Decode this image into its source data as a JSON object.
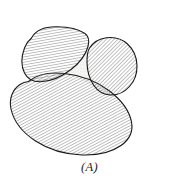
{
  "figure": {
    "caption": "(A)",
    "label": "(A)",
    "background_color": "#ffffff",
    "outline_color": "#1a1a1a",
    "hatch_color": "#6e6e6e",
    "stipple_color": "#b8b8b8",
    "void_fill_color": "#f4f4f2",
    "width": 179,
    "height": 184,
    "shapes": [
      {
        "id": "grain-top-left",
        "name": "top-left-grain",
        "hatch_angle_deg": 80,
        "hatch_spacing_px": 2.6,
        "hatch_color": "#6e6e6e",
        "outline_color": "#1a1a1a",
        "outline_width": 1.1,
        "fill": "#ffffff",
        "path": "M 31.5 38.0 C 36.0 29.5 46.0 26.6 57.0 26.8 C 68.0 27.0 79.5 29.8 85.0 33.5 C 88.8 36.2 89.6 40.5 88.0 46.5 C 86.0 54.0 80.0 62.5 71.0 69.5 C 62.0 76.5 50.0 81.5 40.5 81.8 C 33.0 82.0 27.5 79.0 24.5 73.0 C 21.0 66.0 21.5 56.0 24.5 48.0 C 26.3 43.3 28.8 40.2 31.5 38.0 Z"
      },
      {
        "id": "grain-right",
        "name": "right-grain",
        "hatch_angle_deg": 45,
        "hatch_spacing_px": 2.7,
        "hatch_color": "#6e6e6e",
        "outline_color": "#1a1a1a",
        "outline_width": 1.1,
        "fill": "#ffffff",
        "path": "M 89.5 48.0 C 93.0 42.5 99.0 38.8 106.5 37.8 C 114.5 36.8 122.0 39.0 127.5 44.0 C 133.5 49.5 136.8 57.5 137.0 65.5 C 137.2 73.5 134.5 81.0 129.5 86.5 C 124.5 92.0 117.5 95.3 110.5 95.0 C 103.5 94.7 97.5 91.0 93.5 85.0 C 89.5 79.0 87.2 70.5 87.0 62.5 C 86.9 56.5 87.6 51.2 89.5 48.0 Z"
      },
      {
        "id": "grain-bottom",
        "name": "bottom-grain",
        "hatch_angle_deg": 62,
        "hatch_spacing_px": 2.6,
        "hatch_color": "#6e6e6e",
        "outline_color": "#1a1a1a",
        "outline_width": 1.1,
        "fill": "#ffffff",
        "path": "M 28.5 81.5 C 36.5 74.5 50.0 72.0 64.5 73.5 C 80.5 75.2 97.0 81.5 109.5 91.0 C 121.0 99.8 129.5 111.5 131.5 122.0 C 133.3 131.5 129.5 139.5 121.0 145.5 C 111.5 152.2 97.0 155.5 82.0 155.0 C 65.5 154.4 48.5 149.5 35.5 141.0 C 22.5 132.5 13.5 120.5 11.0 109.0 C 8.8 98.8 12.5 89.5 20.0 84.5 C 22.7 82.7 25.6 81.8 28.5 81.5 Z"
      }
    ],
    "void": {
      "id": "pore-space",
      "name": "pore-void",
      "fill": "#f4f4f2",
      "stipple_color": "#b8b8b8",
      "path": "M 70.5 70.0 C 78.0 64.0 84.5 55.5 87.3 48.5 C 87.0 55.5 88.3 66.0 91.0 74.5 C 93.0 81.0 95.8 86.5 98.5 90.0 C 90.0 83.5 78.5 77.8 66.0 74.2 C 60.0 72.5 54.0 71.5 48.5 71.2 C 55.0 70.4 63.5 73.5 70.5 70.0 Z"
    }
  }
}
